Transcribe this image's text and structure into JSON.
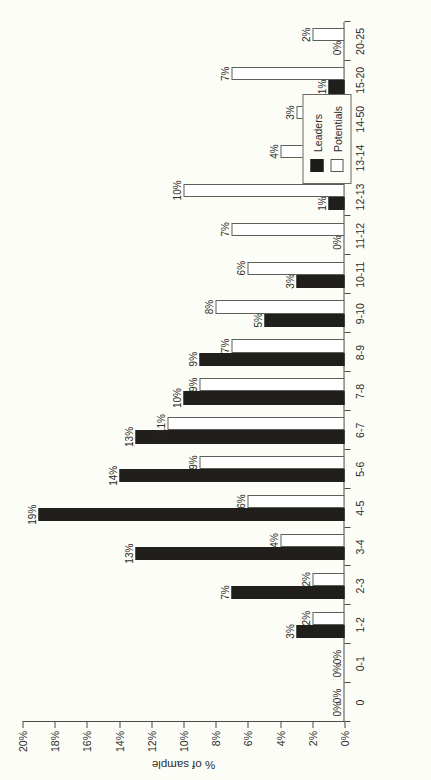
{
  "chart_data": {
    "type": "bar",
    "title": "",
    "xlabel": "",
    "ylabel": "% of sample",
    "ylim": [
      0,
      20
    ],
    "yticks": [
      "0%",
      "2%",
      "4%",
      "6%",
      "8%",
      "10%",
      "12%",
      "14%",
      "16%",
      "18%",
      "20%"
    ],
    "ytick_values": [
      0,
      2,
      4,
      6,
      8,
      10,
      12,
      14,
      16,
      18,
      20
    ],
    "grid": false,
    "legend_position": "top-right",
    "orientation": "rotated-90",
    "categories": [
      "0",
      "0-1",
      "1-2",
      "2-3",
      "3-4",
      "4-5",
      "5-6",
      "6-7",
      "7-8",
      "8-9",
      "9-10",
      "10-11",
      "11-12",
      "12-13",
      "13-14",
      "14-50",
      "15-20",
      "20-25"
    ],
    "series": [
      {
        "name": "Leaders",
        "color": "#211f1c",
        "values": [
          0,
          0,
          3,
          7,
          13,
          19,
          14,
          13,
          10,
          9,
          5,
          3,
          0,
          1,
          1,
          1,
          1,
          0
        ],
        "labels": [
          "0%",
          "0%",
          "3%",
          "7%",
          "13%",
          "19%",
          "14%",
          "13%",
          "10%",
          "9%",
          "5%",
          "3%",
          "0%",
          "1%",
          "1%",
          "1%",
          "1%",
          "0%"
        ]
      },
      {
        "name": "Potentials",
        "color": "#ffffff",
        "values": [
          0,
          0,
          2,
          2,
          4,
          6,
          9,
          11,
          9,
          7,
          8,
          6,
          7,
          10,
          4,
          3,
          7,
          2
        ],
        "labels": [
          "0%",
          "0%",
          "2%",
          "2%",
          "4%",
          "6%",
          "9%",
          "11%",
          "9%",
          "7%",
          "8%",
          "6%",
          "7%",
          "10%",
          "4%",
          "3%",
          "7%",
          "2%"
        ]
      }
    ]
  },
  "legend": {
    "items": [
      {
        "label": "Leaders",
        "swatch": "filled-black"
      },
      {
        "label": "Potentials",
        "swatch": "outlined-white"
      }
    ]
  },
  "axes": {
    "value_axis_title": "% of sample"
  }
}
